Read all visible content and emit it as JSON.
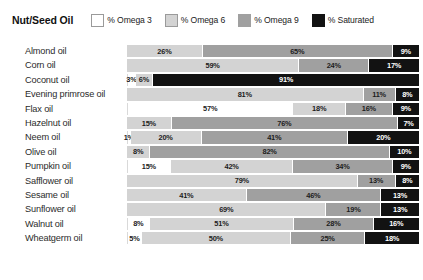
{
  "legend": {
    "title": "Nut/Seed Oil",
    "entries": [
      {
        "label": "% Omega 3",
        "color": "#ffffff",
        "key": "o3",
        "swatch_name": "legend-swatch-omega-3"
      },
      {
        "label": "% Omega 6",
        "color": "#d3d3d3",
        "key": "o6",
        "swatch_name": "legend-swatch-omega-6"
      },
      {
        "label": "% Omega 9",
        "color": "#a0a0a0",
        "key": "o9",
        "swatch_name": "legend-swatch-omega-9"
      },
      {
        "label": "% Saturated",
        "color": "#121212",
        "key": "sat",
        "swatch_name": "legend-swatch-saturated"
      }
    ]
  },
  "chart_data": {
    "type": "bar",
    "orientation": "horizontal",
    "stacked": true,
    "title": "Nut/Seed Oil",
    "xlabel": "",
    "ylabel": "",
    "xlim": [
      0,
      100
    ],
    "grid": false,
    "legend_position": "top",
    "categories": [
      "Almond oil",
      "Corn oil",
      "Coconut oil",
      "Evening primrose oil",
      "Flax oil",
      "Hazelnut oil",
      "Neem oil",
      "Olive oil",
      "Pumpkin oil",
      "Safflower oil",
      "Sesame oil",
      "Sunflower oil",
      "Walnut oil",
      "Wheatgerm oil"
    ],
    "series": [
      {
        "name": "% Omega 3",
        "values": [
          0,
          0,
          3,
          0,
          57,
          0,
          1,
          0,
          15,
          0,
          0,
          0,
          8,
          5
        ]
      },
      {
        "name": "% Omega 6",
        "values": [
          26,
          59,
          6,
          81,
          18,
          15,
          20,
          8,
          42,
          79,
          41,
          69,
          51,
          50
        ]
      },
      {
        "name": "% Omega 9",
        "values": [
          65,
          24,
          0,
          11,
          16,
          76,
          41,
          82,
          34,
          13,
          46,
          19,
          28,
          25
        ]
      },
      {
        "name": "% Saturated",
        "values": [
          9,
          17,
          91,
          8,
          9,
          7,
          20,
          10,
          9,
          8,
          13,
          13,
          16,
          18
        ]
      }
    ],
    "rows": [
      {
        "label": "Almond oil",
        "segments": [
          {
            "key": "o3",
            "value": 0,
            "label": ""
          },
          {
            "key": "o6",
            "value": 26,
            "label": "26%"
          },
          {
            "key": "o9",
            "value": 65,
            "label": "65%"
          },
          {
            "key": "sat",
            "value": 9,
            "label": "9%"
          }
        ]
      },
      {
        "label": "Corn oil",
        "segments": [
          {
            "key": "o3",
            "value": 0,
            "label": ""
          },
          {
            "key": "o6",
            "value": 59,
            "label": "59%"
          },
          {
            "key": "o9",
            "value": 24,
            "label": "24%"
          },
          {
            "key": "sat",
            "value": 17,
            "label": "17%"
          }
        ]
      },
      {
        "label": "Coconut oil",
        "segments": [
          {
            "key": "o3",
            "value": 3,
            "label": "3%"
          },
          {
            "key": "o6",
            "value": 6,
            "label": "6%"
          },
          {
            "key": "o9",
            "value": 0,
            "label": ""
          },
          {
            "key": "sat",
            "value": 91,
            "label": "91%"
          }
        ]
      },
      {
        "label": "Evening primrose oil",
        "segments": [
          {
            "key": "o3",
            "value": 0,
            "label": ""
          },
          {
            "key": "o6",
            "value": 81,
            "label": "81%"
          },
          {
            "key": "o9",
            "value": 11,
            "label": "11%"
          },
          {
            "key": "sat",
            "value": 8,
            "label": "8%"
          }
        ]
      },
      {
        "label": "Flax oil",
        "segments": [
          {
            "key": "o3",
            "value": 57,
            "label": "57%"
          },
          {
            "key": "o6",
            "value": 18,
            "label": "18%"
          },
          {
            "key": "o9",
            "value": 16,
            "label": "16%"
          },
          {
            "key": "sat",
            "value": 9,
            "label": "9%"
          }
        ]
      },
      {
        "label": "Hazelnut oil",
        "segments": [
          {
            "key": "o3",
            "value": 0,
            "label": ""
          },
          {
            "key": "o6",
            "value": 15,
            "label": "15%"
          },
          {
            "key": "o9",
            "value": 76,
            "label": "76%"
          },
          {
            "key": "sat",
            "value": 7,
            "label": "7%"
          }
        ]
      },
      {
        "label": "Neem oil",
        "segments": [
          {
            "key": "o3",
            "value": 1,
            "label": "1%"
          },
          {
            "key": "o6",
            "value": 20,
            "label": "20%"
          },
          {
            "key": "o9",
            "value": 41,
            "label": "41%"
          },
          {
            "key": "sat",
            "value": 20,
            "label": "20%"
          }
        ]
      },
      {
        "label": "Olive oil",
        "segments": [
          {
            "key": "o3",
            "value": 0,
            "label": ""
          },
          {
            "key": "o6",
            "value": 8,
            "label": "8%"
          },
          {
            "key": "o9",
            "value": 82,
            "label": "82%"
          },
          {
            "key": "sat",
            "value": 10,
            "label": "10%"
          }
        ]
      },
      {
        "label": "Pumpkin oil",
        "segments": [
          {
            "key": "o3",
            "value": 15,
            "label": "15%"
          },
          {
            "key": "o6",
            "value": 42,
            "label": "42%"
          },
          {
            "key": "o9",
            "value": 34,
            "label": "34%"
          },
          {
            "key": "sat",
            "value": 9,
            "label": "9%"
          }
        ]
      },
      {
        "label": "Safflower oil",
        "segments": [
          {
            "key": "o3",
            "value": 0,
            "label": ""
          },
          {
            "key": "o6",
            "value": 79,
            "label": "79%"
          },
          {
            "key": "o9",
            "value": 13,
            "label": "13%"
          },
          {
            "key": "sat",
            "value": 8,
            "label": "8%"
          }
        ]
      },
      {
        "label": "Sesame oil",
        "segments": [
          {
            "key": "o3",
            "value": 0,
            "label": ""
          },
          {
            "key": "o6",
            "value": 41,
            "label": "41%"
          },
          {
            "key": "o9",
            "value": 46,
            "label": "46%"
          },
          {
            "key": "sat",
            "value": 13,
            "label": "13%"
          }
        ]
      },
      {
        "label": "Sunflower oil",
        "segments": [
          {
            "key": "o3",
            "value": 0,
            "label": ""
          },
          {
            "key": "o6",
            "value": 69,
            "label": "69%"
          },
          {
            "key": "o9",
            "value": 19,
            "label": "19%"
          },
          {
            "key": "sat",
            "value": 13,
            "label": "13%"
          }
        ]
      },
      {
        "label": "Walnut oil",
        "segments": [
          {
            "key": "o3",
            "value": 8,
            "label": "8%"
          },
          {
            "key": "o6",
            "value": 51,
            "label": "51%"
          },
          {
            "key": "o9",
            "value": 28,
            "label": "28%"
          },
          {
            "key": "sat",
            "value": 16,
            "label": "16%"
          }
        ]
      },
      {
        "label": "Wheatgerm oil",
        "segments": [
          {
            "key": "o3",
            "value": 5,
            "label": "5%"
          },
          {
            "key": "o6",
            "value": 50,
            "label": "50%"
          },
          {
            "key": "o9",
            "value": 25,
            "label": "25%"
          },
          {
            "key": "sat",
            "value": 18,
            "label": "18%"
          }
        ]
      }
    ]
  }
}
